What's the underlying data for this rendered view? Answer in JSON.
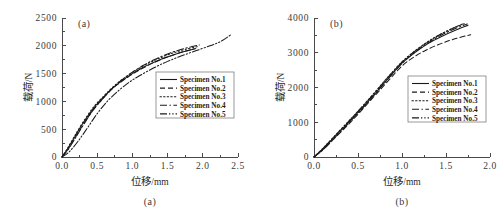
{
  "figure": {
    "background": "#ffffff",
    "ink_color": "#1a1a1a",
    "axis_color": "#4a4a4a",
    "panel_count": 2
  },
  "chart_data": [
    {
      "type": "line",
      "panel_tag": "(a)",
      "caption": "(a)",
      "title": "",
      "xlabel": "位移",
      "xlabel_unit": "/mm",
      "ylabel": "载荷",
      "ylabel_unit": "/N",
      "xlim": [
        0.0,
        2.5
      ],
      "ylim": [
        0,
        2500
      ],
      "xticks": [
        0.0,
        0.5,
        1.0,
        1.5,
        2.0,
        2.5
      ],
      "xtick_labels": [
        "0.0",
        "0.5",
        "1.0",
        "1.5",
        "2.0",
        "2.5"
      ],
      "yticks": [
        0,
        500,
        1000,
        1500,
        2000,
        2500
      ],
      "ytick_labels": [
        "0",
        "500",
        "1000",
        "1500",
        "2000",
        "2500"
      ],
      "minor_x_step": 0.25,
      "minor_y_step": 250,
      "grid": false,
      "legend_position": "center-right",
      "series": [
        {
          "name": "Specimen No.1",
          "style": "solid",
          "dash": "none",
          "x": [
            0.0,
            0.08,
            0.18,
            0.3,
            0.45,
            0.6,
            0.72,
            0.85,
            1.0,
            1.15,
            1.3,
            1.45,
            1.6,
            1.75,
            1.9
          ],
          "y": [
            0,
            150,
            360,
            610,
            880,
            1090,
            1240,
            1370,
            1500,
            1610,
            1700,
            1780,
            1845,
            1900,
            1950
          ]
        },
        {
          "name": "Specimen No.2",
          "style": "dashed",
          "dash": "5,3",
          "x": [
            0.0,
            0.08,
            0.18,
            0.3,
            0.45,
            0.6,
            0.72,
            0.85,
            1.0,
            1.15,
            1.3,
            1.45,
            1.6,
            1.75,
            1.88
          ],
          "y": [
            0,
            130,
            330,
            580,
            860,
            1075,
            1235,
            1360,
            1490,
            1600,
            1695,
            1775,
            1845,
            1905,
            1945
          ]
        },
        {
          "name": "Specimen No.3",
          "style": "dotted",
          "dash": "1.4,2.2",
          "x": [
            0.0,
            0.08,
            0.18,
            0.3,
            0.45,
            0.6,
            0.72,
            0.85,
            1.0,
            1.15,
            1.3,
            1.45,
            1.6,
            1.75,
            1.92
          ],
          "y": [
            0,
            160,
            380,
            630,
            900,
            1105,
            1255,
            1390,
            1520,
            1635,
            1730,
            1810,
            1880,
            1935,
            1985
          ]
        },
        {
          "name": "Specimen No.4",
          "style": "dashdot",
          "dash": "7,2.5,1.4,2.5",
          "x": [
            0.0,
            0.08,
            0.18,
            0.3,
            0.45,
            0.6,
            0.72,
            0.85,
            1.0,
            1.15,
            1.3,
            1.45,
            1.6,
            1.75,
            1.95
          ],
          "y": [
            0,
            120,
            320,
            570,
            855,
            1080,
            1245,
            1385,
            1525,
            1645,
            1745,
            1830,
            1900,
            1955,
            2015
          ]
        },
        {
          "name": "Specimen No.5",
          "style": "dashdotdot",
          "dash": "7,2,1.3,2,1.3,2",
          "x": [
            0.0,
            0.1,
            0.22,
            0.36,
            0.5,
            0.65,
            0.8,
            0.95,
            1.1,
            1.3,
            1.5,
            1.7,
            1.9,
            2.1,
            2.25,
            2.4
          ],
          "y": [
            0,
            90,
            270,
            520,
            780,
            1010,
            1190,
            1340,
            1460,
            1600,
            1720,
            1820,
            1910,
            2000,
            2075,
            2200
          ]
        }
      ]
    },
    {
      "type": "line",
      "panel_tag": "(b)",
      "caption": "(b)",
      "title": "",
      "xlabel": "位移",
      "xlabel_unit": "/mm",
      "ylabel": "载荷",
      "ylabel_unit": "/N",
      "xlim": [
        0.0,
        2.0
      ],
      "ylim": [
        0,
        4000
      ],
      "xticks": [
        0.0,
        0.5,
        1.0,
        1.5,
        2.0
      ],
      "xtick_labels": [
        "0.0",
        "0.5",
        "1.0",
        "1.5",
        "2.0"
      ],
      "yticks": [
        0,
        1000,
        2000,
        3000,
        4000
      ],
      "ytick_labels": [
        "0",
        "1000",
        "2000",
        "3000",
        "4000"
      ],
      "minor_x_step": 0.25,
      "minor_y_step": 500,
      "grid": false,
      "legend_position": "center-right",
      "series": [
        {
          "name": "Specimen No.1",
          "style": "solid",
          "dash": "none",
          "x": [
            0.0,
            0.1,
            0.25,
            0.4,
            0.55,
            0.7,
            0.85,
            1.0,
            1.15,
            1.3,
            1.45,
            1.6,
            1.75
          ],
          "y": [
            0,
            230,
            620,
            1010,
            1420,
            1840,
            2280,
            2700,
            3010,
            3270,
            3470,
            3640,
            3790
          ]
        },
        {
          "name": "Specimen No.2",
          "style": "dashed",
          "dash": "5,3",
          "x": [
            0.0,
            0.1,
            0.25,
            0.4,
            0.55,
            0.7,
            0.85,
            1.0,
            1.15,
            1.3,
            1.45,
            1.6,
            1.78
          ],
          "y": [
            0,
            210,
            580,
            960,
            1370,
            1790,
            2210,
            2620,
            2900,
            3110,
            3270,
            3400,
            3520
          ]
        },
        {
          "name": "Specimen No.3",
          "style": "dotted",
          "dash": "1.4,2.2",
          "x": [
            0.0,
            0.1,
            0.25,
            0.4,
            0.55,
            0.7,
            0.85,
            1.0,
            1.15,
            1.3,
            1.45,
            1.6,
            1.72
          ],
          "y": [
            0,
            250,
            650,
            1050,
            1460,
            1890,
            2330,
            2740,
            3060,
            3330,
            3550,
            3730,
            3850
          ]
        },
        {
          "name": "Specimen No.4",
          "style": "dashdot",
          "dash": "7,2.5,1.4,2.5",
          "x": [
            0.0,
            0.1,
            0.25,
            0.4,
            0.55,
            0.7,
            0.85,
            1.0,
            1.15,
            1.3,
            1.45,
            1.6,
            1.74
          ],
          "y": [
            0,
            200,
            590,
            990,
            1400,
            1830,
            2270,
            2690,
            3020,
            3290,
            3510,
            3690,
            3830
          ]
        },
        {
          "name": "Specimen No.5",
          "style": "dashdotdot",
          "dash": "7,2,1.3,2,1.3,2",
          "x": [
            0.0,
            0.1,
            0.25,
            0.4,
            0.55,
            0.7,
            0.85,
            1.0,
            1.15,
            1.3,
            1.45,
            1.6,
            1.7
          ],
          "y": [
            0,
            240,
            640,
            1040,
            1450,
            1880,
            2320,
            2730,
            3050,
            3320,
            3545,
            3730,
            3840
          ]
        }
      ]
    }
  ]
}
